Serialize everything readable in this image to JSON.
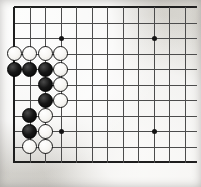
{
  "figure": {
    "kind": "go-board-diagram",
    "title": "Go board corner position",
    "caption": "",
    "board": {
      "columns_visible": 12,
      "rows_visible": 11,
      "cell_size": 15.5,
      "origin_x": 14,
      "origin_y": 7,
      "line_color": "#4c4c4c",
      "edge_color": "#1e1e1e",
      "background_color": "#eceae5",
      "left_edge": true,
      "bottom_edge": true,
      "top_edge": true,
      "right_edge": false
    },
    "star_points": [
      {
        "col": 4,
        "row": 3
      },
      {
        "col": 10,
        "row": 3
      },
      {
        "col": 4,
        "row": 9
      },
      {
        "col": 10,
        "row": 9
      }
    ],
    "stones": [
      {
        "color": "white",
        "col": 1,
        "row": 4
      },
      {
        "color": "white",
        "col": 2,
        "row": 4
      },
      {
        "color": "white",
        "col": 3,
        "row": 4
      },
      {
        "color": "white",
        "col": 4,
        "row": 4
      },
      {
        "color": "black",
        "col": 1,
        "row": 5
      },
      {
        "color": "black",
        "col": 2,
        "row": 5
      },
      {
        "color": "black",
        "col": 3,
        "row": 5
      },
      {
        "color": "white",
        "col": 4,
        "row": 5
      },
      {
        "color": "black",
        "col": 3,
        "row": 6
      },
      {
        "color": "white",
        "col": 4,
        "row": 6
      },
      {
        "color": "black",
        "col": 3,
        "row": 7
      },
      {
        "color": "white",
        "col": 4,
        "row": 7
      },
      {
        "color": "black",
        "col": 2,
        "row": 8
      },
      {
        "color": "white",
        "col": 3,
        "row": 8
      },
      {
        "color": "black",
        "col": 2,
        "row": 9
      },
      {
        "color": "white",
        "col": 3,
        "row": 9
      },
      {
        "color": "white",
        "col": 2,
        "row": 10
      },
      {
        "color": "white",
        "col": 3,
        "row": 10
      }
    ],
    "stone_counts": {
      "black": 7,
      "white": 11
    },
    "colors": {
      "black_stone": "#161616",
      "white_stone": "#f7f6f3",
      "star_point": "#141414"
    }
  }
}
